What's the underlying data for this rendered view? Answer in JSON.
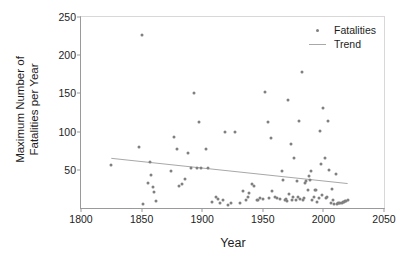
{
  "chart_data": {
    "type": "scatter",
    "title": "",
    "xlabel": "Year",
    "ylabel": "Maximum Number of\nFatalities per Year",
    "xlim": [
      1800,
      2050
    ],
    "ylim": [
      0,
      250
    ],
    "xticks": [
      1800,
      1850,
      1900,
      1950,
      2000,
      2050
    ],
    "yticks": [
      50,
      100,
      150,
      200,
      250
    ],
    "grid": false,
    "legend_position": "top-right",
    "marker_color": "#808080",
    "trend_color": "#a8a8a8",
    "axis_color": "#9a9a9a",
    "text_color": "#1d1d1d",
    "series": [
      {
        "name": "Fatalities",
        "type": "scatter",
        "x": [
          1825,
          1848,
          1850,
          1851,
          1855,
          1857,
          1858,
          1859,
          1860,
          1862,
          1874,
          1877,
          1879,
          1881,
          1883,
          1886,
          1888,
          1891,
          1893,
          1896,
          1897,
          1899,
          1903,
          1905,
          1908,
          1911,
          1913,
          1915,
          1917,
          1919,
          1921,
          1924,
          1927,
          1931,
          1934,
          1936,
          1938,
          1939,
          1941,
          1943,
          1945,
          1946,
          1948,
          1950,
          1952,
          1954,
          1955,
          1957,
          1958,
          1960,
          1962,
          1964,
          1966,
          1967,
          1968,
          1969,
          1970,
          1971,
          1972,
          1973,
          1974,
          1975,
          1976,
          1977,
          1978,
          1979,
          1980,
          1981,
          1982,
          1983,
          1984,
          1985,
          1986,
          1987,
          1988,
          1989,
          1990,
          1991,
          1992,
          1993,
          1994,
          1995,
          1996,
          1997,
          1998,
          1999,
          2000,
          2001,
          2002,
          2003,
          2004,
          2005,
          2006,
          2007,
          2008,
          2009,
          2010,
          2011,
          2012,
          2013,
          2014,
          2015,
          2016,
          2017,
          2018,
          2019,
          2020
        ],
        "y": [
          56,
          80,
          227,
          5,
          33,
          60,
          43,
          28,
          21,
          9,
          48,
          93,
          77,
          29,
          31,
          38,
          72,
          52,
          151,
          52,
          112,
          52,
          77,
          52,
          8,
          14,
          12,
          7,
          10,
          100,
          4,
          7,
          100,
          7,
          22,
          11,
          14,
          20,
          31,
          29,
          10,
          11,
          13,
          12,
          152,
          112,
          13,
          91,
          22,
          14,
          13,
          12,
          48,
          36,
          11,
          12,
          9,
          141,
          18,
          84,
          10,
          15,
          66,
          11,
          35,
          14,
          114,
          12,
          178,
          11,
          13,
          33,
          35,
          23,
          42,
          36,
          48,
          11,
          15,
          23,
          24,
          8,
          13,
          101,
          58,
          17,
          131,
          66,
          13,
          14,
          114,
          50,
          7,
          25,
          11,
          5,
          44,
          5,
          6,
          6,
          7,
          7,
          8,
          8,
          9,
          9,
          10
        ]
      },
      {
        "name": "Trend",
        "type": "line",
        "x": [
          1825,
          2020
        ],
        "y": [
          65,
          32
        ]
      }
    ],
    "legend": [
      {
        "label": "Fatalities",
        "marker": "dot",
        "color": "#808080"
      },
      {
        "label": "Trend",
        "marker": "line",
        "color": "#a8a8a8"
      }
    ]
  }
}
